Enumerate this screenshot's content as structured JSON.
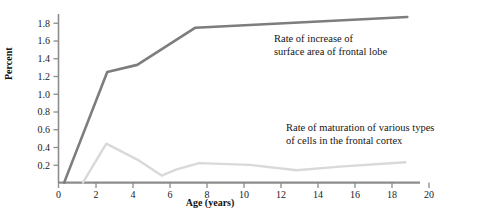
{
  "figure": {
    "background": "#ffffff",
    "axis_color": "#8c8c8c"
  },
  "axes": {
    "y_title": "Percent",
    "x_title": "Age (years)",
    "y_ticks": [
      "0.2",
      "0.4",
      "0.6",
      "0.8",
      "1.0",
      "1.2",
      "1.4",
      "1.6",
      "1.8"
    ],
    "x_ticks": [
      "0",
      "2",
      "4",
      "6",
      "8",
      "10",
      "12",
      "14",
      "16",
      "18",
      "20"
    ]
  },
  "annotations": {
    "frontal_lobe_line1": "Rate of increase of",
    "frontal_lobe_line2": "surface area of frontal lobe",
    "maturation_line1": "Rate of maturation of various types",
    "maturation_line2": "of cells in the frontal cortex"
  },
  "chart_data": {
    "type": "line",
    "title": "",
    "xlabel": "Age (years)",
    "ylabel": "Percent",
    "xlim": [
      0,
      22.5
    ],
    "ylim": [
      0,
      1.95
    ],
    "grid": false,
    "legend": "annotations-inline",
    "series": [
      {
        "name": "Rate of increase of surface area of frontal lobe",
        "color": "#7d7d7d",
        "width": 2.6,
        "points": [
          [
            0.3,
            0.0
          ],
          [
            2.6,
            1.25
          ],
          [
            4.2,
            1.33
          ],
          [
            7.3,
            1.75
          ],
          [
            18.6,
            1.87
          ]
        ]
      },
      {
        "name": "Rate of maturation of various types of cells in the frontal cortex",
        "color": "#d9d9d9",
        "width": 2.4,
        "points": [
          [
            1.3,
            0.0
          ],
          [
            2.55,
            0.44
          ],
          [
            4.2,
            0.26
          ],
          [
            5.5,
            0.08
          ],
          [
            6.3,
            0.15
          ],
          [
            7.5,
            0.22
          ],
          [
            10.2,
            0.2
          ],
          [
            12.7,
            0.14
          ],
          [
            15.0,
            0.18
          ],
          [
            18.5,
            0.23
          ]
        ]
      }
    ]
  }
}
